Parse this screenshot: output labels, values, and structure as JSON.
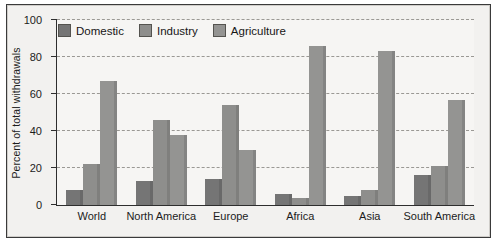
{
  "chart_data": {
    "type": "bar",
    "title": "",
    "xlabel": "",
    "ylabel": "Percent of total withdrawals",
    "ylim": [
      0,
      100
    ],
    "yticks": [
      0,
      20,
      40,
      60,
      80,
      100
    ],
    "grid": "horizontal-dashed",
    "legend_position": "top-left-inside",
    "categories": [
      "World",
      "North America",
      "Europe",
      "Africa",
      "Asia",
      "South America"
    ],
    "series": [
      {
        "name": "Domestic",
        "color": "#757575",
        "values": [
          8,
          13,
          14,
          6,
          5,
          16
        ]
      },
      {
        "name": "Industry",
        "color": "#8e8e8c",
        "values": [
          22,
          46,
          54,
          4,
          8,
          21
        ]
      },
      {
        "name": "Agriculture",
        "color": "#949492",
        "values": [
          67,
          38,
          30,
          86,
          83,
          57
        ]
      }
    ]
  },
  "axis": {
    "y_title": "Percent of total withdrawals",
    "y_tick_labels": [
      "100",
      "80",
      "60",
      "40",
      "20",
      "0"
    ]
  },
  "legend": {
    "items": [
      {
        "label": "Domestic"
      },
      {
        "label": "Industry"
      },
      {
        "label": "Agriculture"
      }
    ]
  },
  "groups": [
    {
      "label": "World"
    },
    {
      "label": "North America"
    },
    {
      "label": "Europe"
    },
    {
      "label": "Africa"
    },
    {
      "label": "Asia"
    },
    {
      "label": "South America"
    }
  ]
}
